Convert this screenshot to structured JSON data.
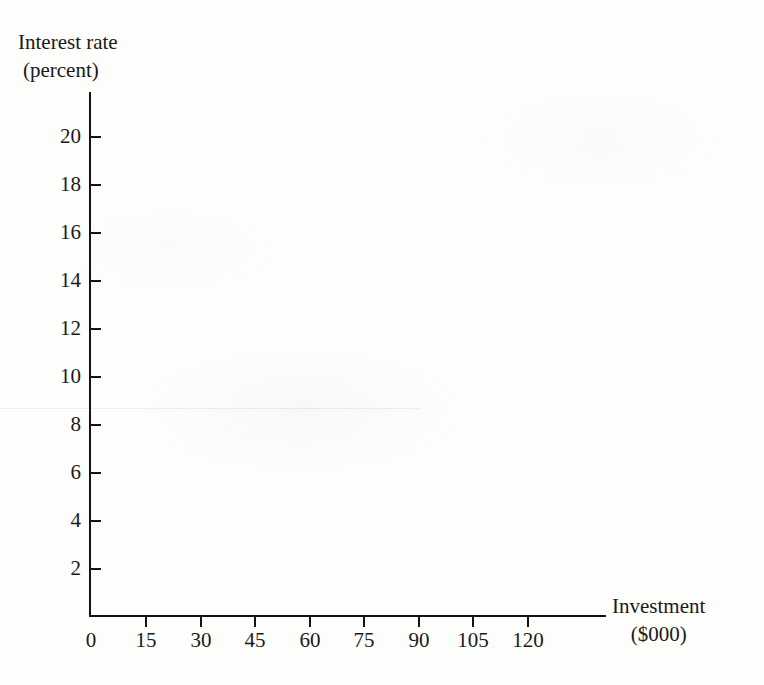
{
  "figure": {
    "background_color": "#fdfdfc",
    "ink_color": "#1a1a1a"
  },
  "chart_data": {
    "type": "line",
    "title": "",
    "subtitle": "",
    "xlabel": "Investment ($000)",
    "xlabel_lines": [
      "Investment",
      "($000)"
    ],
    "ylabel": "Interest rate (percent)",
    "ylabel_lines": [
      "Interest rate",
      "(percent)"
    ],
    "grid": false,
    "legend": null,
    "series": [],
    "annotations": [],
    "note": "Blank axes template — no data series plotted in the figure.",
    "x": {
      "ticks": [
        0,
        15,
        30,
        45,
        60,
        75,
        90,
        105,
        120
      ],
      "tick_labels": [
        "0",
        "15",
        "30",
        "45",
        "60",
        "75",
        "90",
        "105",
        "120"
      ],
      "xlim": [
        0,
        128
      ],
      "tick_direction": "down"
    },
    "y": {
      "ticks": [
        2,
        4,
        6,
        8,
        10,
        12,
        14,
        16,
        18,
        20
      ],
      "tick_labels": [
        "2",
        "4",
        "6",
        "8",
        "10",
        "12",
        "14",
        "16",
        "18",
        "20"
      ],
      "ylim": [
        0,
        22
      ],
      "tick_direction": "right"
    }
  },
  "axes": {
    "y_title_line1": "Interest rate",
    "y_title_line2": "(percent)",
    "x_title_line1": "Investment",
    "x_title_line2": "($000)",
    "origin_label": "0"
  },
  "y_ticks": [
    {
      "label": "20",
      "top": 136
    },
    {
      "label": "18",
      "top": 184
    },
    {
      "label": "16",
      "top": 232
    },
    {
      "label": "14",
      "top": 280
    },
    {
      "label": "12",
      "top": 328
    },
    {
      "label": "10",
      "top": 376
    },
    {
      "label": "8",
      "top": 424
    },
    {
      "label": "6",
      "top": 472
    },
    {
      "label": "4",
      "top": 520
    },
    {
      "label": "2",
      "top": 568
    }
  ],
  "x_ticks": [
    {
      "label": "0",
      "left": 90
    },
    {
      "label": "15",
      "left": 145
    },
    {
      "label": "30",
      "left": 200
    },
    {
      "label": "45",
      "left": 254
    },
    {
      "label": "60",
      "left": 309
    },
    {
      "label": "75",
      "left": 363
    },
    {
      "label": "90",
      "left": 418
    },
    {
      "label": "105",
      "left": 472
    },
    {
      "label": "120",
      "left": 527
    }
  ]
}
